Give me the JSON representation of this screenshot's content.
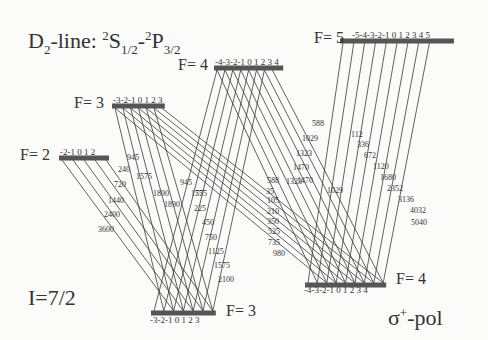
{
  "title": {
    "prefix": "D",
    "prefix_sub": "2",
    "mid": "-line: ",
    "s_sup": "2",
    "s_letter": "S",
    "s_sub": "1/2",
    "dash": "-",
    "p_sup": "2",
    "p_letter": "P",
    "p_sub": "3/2"
  },
  "nuclear_spin": "I=7/2",
  "polarization": {
    "sigma": "σ",
    "sup": "+",
    "suffix": "-pol"
  },
  "levels": {
    "upper": [
      {
        "label": "F= 2",
        "m": "-2-1 0 1 2",
        "mvals": [
          -2,
          -1,
          0,
          1,
          2
        ]
      },
      {
        "label": "F= 3",
        "m": "-3-2-1 0 1 2 3",
        "mvals": [
          -3,
          -2,
          -1,
          0,
          1,
          2,
          3
        ]
      },
      {
        "label": "F= 4",
        "m": "-4-3-2-1 0 1 2 3 4",
        "mvals": [
          -4,
          -3,
          -2,
          -1,
          0,
          1,
          2,
          3,
          4
        ]
      },
      {
        "label": "F= 5",
        "m": "-5-4-3-2-1 0 1 2 3 4 5",
        "mvals": [
          -5,
          -4,
          -3,
          -2,
          -1,
          0,
          1,
          2,
          3,
          4,
          5
        ]
      }
    ],
    "lower": [
      {
        "label": "F= 3",
        "m": "-3-2-1 0 1 2 3",
        "mvals": [
          -3,
          -2,
          -1,
          0,
          1,
          2,
          3
        ]
      },
      {
        "label": "F= 4",
        "m": "-4-3-2-1 0 1 2 3 4",
        "mvals": [
          -4,
          -3,
          -2,
          -1,
          0,
          1,
          2,
          3,
          4
        ]
      }
    ]
  },
  "transition_strengths": {
    "F2_to_F3": [
      "240",
      "720",
      "1440",
      "2400",
      "3600"
    ],
    "F3_to_F3": [
      "945",
      "1575",
      "1890",
      "1890",
      "1575",
      "945"
    ],
    "F3_to_F4": [
      "75",
      "225",
      "450",
      "750",
      "1125",
      "1575",
      "2100"
    ],
    "F4_to_F3": [
      "588",
      "1029",
      "1323",
      "1470",
      "1470",
      "1323",
      "1029",
      "588"
    ],
    "F4_to_F4": [
      "35",
      "105",
      "210",
      "350",
      "525",
      "735",
      "980"
    ],
    "F5_to_F4": [
      "112",
      "336",
      "672",
      "1120",
      "1680",
      "2352",
      "3136",
      "4032",
      "5040"
    ]
  },
  "colors": {
    "line": "#3a3a3a",
    "level": "#555555",
    "background": "#fbfbf9"
  }
}
